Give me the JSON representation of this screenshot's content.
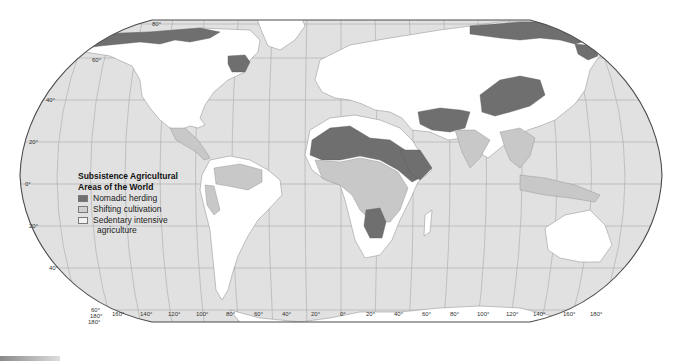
{
  "legend": {
    "title_line1": "Subsistence Agricultural",
    "title_line2": "Areas of the World",
    "items": [
      {
        "label": "Nomadic herding",
        "color": "#6f6f6f"
      },
      {
        "label": "Shifting cultivation",
        "color": "#c8c8c8"
      },
      {
        "label": "Sedentary intensive",
        "label_line2": "agriculture",
        "color": "#ffffff"
      }
    ]
  },
  "latitude_labels": {
    "n80": "80°",
    "n60": "60°",
    "n40": "40°",
    "n20": "20°",
    "eq": "0°",
    "s20": "20°",
    "s40": "40°",
    "s60": "60°"
  },
  "longitude_labels": [
    "180°",
    "160°",
    "140°",
    "120°",
    "100°",
    "80°",
    "60°",
    "40°",
    "20°",
    "0°",
    "20°",
    "40°",
    "60°",
    "80°",
    "100°",
    "120°",
    "140°",
    "160°",
    "180°"
  ],
  "colors": {
    "ocean": "#e1e1e1",
    "sedentary_land": "#ffffff",
    "shifting": "#c8c8c8",
    "nomadic": "#6f6f6f"
  }
}
